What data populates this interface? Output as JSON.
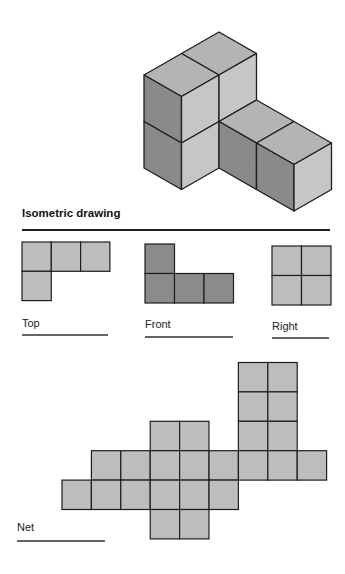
{
  "colors": {
    "top": "#b4b4b4",
    "left": "#8a8a8a",
    "right": "#c6c6c6",
    "view_light": "#bdbdbd",
    "view_dark": "#8b8b8b",
    "stroke": "#1e1e1e"
  },
  "isometric": {
    "title": "Isometric drawing",
    "faces": [
      {
        "name": "tall-top-back",
        "shade": "top",
        "pts": "219,32 256.5,53.5 219,75 181.5,53.5"
      },
      {
        "name": "tall-top-front",
        "shade": "top",
        "pts": "181.5,53.5 219,75 181.5,96.5 144,75"
      },
      {
        "name": "tall-left-upper",
        "shade": "left",
        "pts": "144,75 181.5,96.5 181.5,143 144,121.5"
      },
      {
        "name": "tall-left-lower",
        "shade": "left",
        "pts": "144,121.5 181.5,143 181.5,189.5 144,168"
      },
      {
        "name": "tall-right-upper-front",
        "shade": "right",
        "pts": "181.5,96.5 219,75 219,121.5 181.5,143"
      },
      {
        "name": "tall-right-lower-front",
        "shade": "right",
        "pts": "181.5,143 219,121.5 219,168 181.5,189.5"
      },
      {
        "name": "tall-right-upper-back",
        "shade": "right",
        "pts": "219,75 256.5,53.5 256.5,100 219,121.5"
      },
      {
        "name": "wing-top-1",
        "shade": "top",
        "pts": "256.5,100 294,121.5 256.5,143 219,121.5"
      },
      {
        "name": "wing-top-2",
        "shade": "top",
        "pts": "294,121.5 331.5,143 294,164.5 256.5,143"
      },
      {
        "name": "wing-left-1",
        "shade": "left",
        "pts": "219,121.5 256.5,143 256.5,189.5 219,168"
      },
      {
        "name": "wing-left-2",
        "shade": "left",
        "pts": "256.5,143 294,164.5 294,211 256.5,189.5"
      },
      {
        "name": "wing-right",
        "shade": "right",
        "pts": "294,164.5 331.5,143 331.5,189.5 294,211"
      }
    ]
  },
  "views": [
    {
      "label": "Top",
      "shade": "view_light",
      "x": 22,
      "y": 242,
      "cell": 29.3,
      "cells": [
        [
          0,
          0
        ],
        [
          1,
          0
        ],
        [
          2,
          0
        ],
        [
          0,
          1
        ]
      ],
      "label_x": 22,
      "label_y": 317,
      "line": [
        22,
        335,
        108
      ]
    },
    {
      "label": "Front",
      "shade": "view_dark",
      "x": 145,
      "y": 244,
      "cell": 29.5,
      "cells": [
        [
          0,
          0
        ],
        [
          0,
          1
        ],
        [
          1,
          1
        ],
        [
          2,
          1
        ]
      ],
      "label_x": 145,
      "label_y": 318,
      "line": [
        145,
        337,
        233
      ]
    },
    {
      "label": "Right",
      "shade": "view_light",
      "x": 272,
      "y": 246,
      "cell": 29.5,
      "cells": [
        [
          0,
          0
        ],
        [
          1,
          0
        ],
        [
          0,
          1
        ],
        [
          1,
          1
        ]
      ],
      "label_x": 272,
      "label_y": 320,
      "line": [
        272,
        338,
        329
      ]
    }
  ],
  "net": {
    "label": "Net",
    "x": 62,
    "y": 362.5,
    "cell": 29.4,
    "cells": [
      [
        6,
        0
      ],
      [
        7,
        0
      ],
      [
        6,
        1
      ],
      [
        7,
        1
      ],
      [
        6,
        2
      ],
      [
        7,
        2
      ],
      [
        3,
        2
      ],
      [
        4,
        2
      ],
      [
        1,
        3
      ],
      [
        2,
        3
      ],
      [
        3,
        3
      ],
      [
        4,
        3
      ],
      [
        5,
        3
      ],
      [
        6,
        3
      ],
      [
        7,
        3
      ],
      [
        8,
        3
      ],
      [
        0,
        4
      ],
      [
        1,
        4
      ],
      [
        2,
        4
      ],
      [
        3,
        4
      ],
      [
        4,
        4
      ],
      [
        5,
        4
      ],
      [
        3,
        5
      ],
      [
        4,
        5
      ]
    ],
    "label_x": 17,
    "label_y": 521,
    "line": [
      17,
      541,
      105
    ]
  }
}
